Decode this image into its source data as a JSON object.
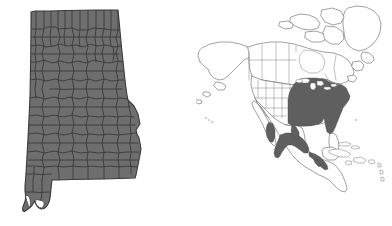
{
  "figure": {
    "title": "Species distribution map",
    "background_color": "#ffffff",
    "width": 392,
    "height": 226,
    "panel_count": 2
  },
  "panels": [
    {
      "id": "state-panel",
      "name": "alabama-county-map",
      "title": "Alabama",
      "description": "Outline map of the state of Alabama subdivided into counties, every county shaded solid gray",
      "region_type": "state",
      "subdivision_type": "county",
      "counties_total": 67,
      "counties_shaded": 67,
      "fill_color": "#6e6e6e",
      "boundary_color": "#3a3a3a",
      "background_color": "#ffffff"
    },
    {
      "id": "continent-panel",
      "name": "north-america-range-map",
      "title": "North America",
      "description": "Outline map of North America with state, provincial and national boundaries; shaded gray areas indicate the species range",
      "region_type": "continent",
      "subdivision_type": "state-province",
      "fill_color": "#5f5f5f",
      "outline_color": "#555555",
      "admin_line_color": "#777777",
      "background_color": "#ffffff",
      "shaded_regions": [
        "Eastern United States",
        "Great Lakes states",
        "Mid-Atlantic",
        "Southeastern United States",
        "Northern Florida",
        "Eastern Texas",
        "Sierra Madre Occidental (Mexico)",
        "Sierra Madre Oriental (Mexico)",
        "Trans-Mexican Volcanic Belt",
        "Southern Mexico highlands",
        "Guatemala highlands"
      ],
      "unshaded_regions": [
        "Alaska",
        "Northern and Arctic Canada",
        "Greenland",
        "Western United States",
        "Great Basin",
        "Pacific Northwest",
        "Baja California",
        "Southern Florida",
        "Caribbean islands"
      ]
    }
  ],
  "legend": {
    "shown": false,
    "shaded_meaning": "Range present",
    "unshaded_meaning": "Range absent"
  },
  "colors": {
    "state_fill": "#6e6e6e",
    "range_fill": "#5f5f5f",
    "county_line": "#3a3a3a",
    "coastline": "#555555",
    "admin_line": "#777777",
    "background": "#ffffff"
  }
}
